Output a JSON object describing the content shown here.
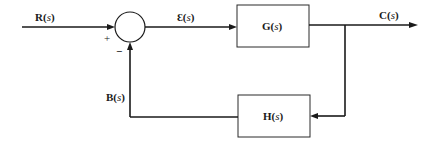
{
  "diagram": {
    "type": "closed-loop feedback control block diagram",
    "signals": {
      "input": {
        "name": "R",
        "arg": "s"
      },
      "error": {
        "name": "Ɛ",
        "arg": "s"
      },
      "output": {
        "name": "C",
        "arg": "s"
      },
      "feedback": {
        "name": "B",
        "arg": "s"
      }
    },
    "blocks": {
      "forward": {
        "name": "G",
        "arg": "s"
      },
      "feedback": {
        "name": "H",
        "arg": "s"
      }
    },
    "summing_junction": {
      "plus_sign": "+",
      "minus_sign": "−"
    },
    "punct": {
      "open": "(",
      "close": ")"
    },
    "colors": {
      "line": "#1a1a1a",
      "background": "#ffffff"
    }
  }
}
